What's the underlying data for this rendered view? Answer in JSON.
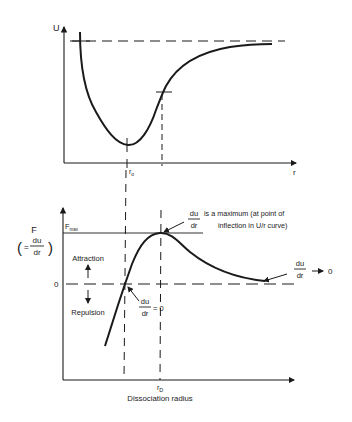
{
  "top_chart": {
    "y_axis_label": "U",
    "x_axis_label": "r",
    "r0_label": "r",
    "r0_subscript": "o",
    "asymptote": "dashed horizontal line (U → 0 at large r)",
    "curve": "potential energy well: steep repulsive wall at small r, minimum at r0, inflection point, asymptotic approach to dashed line",
    "curve_points": [
      [
        80,
        32
      ],
      [
        82,
        60
      ],
      [
        88,
        90
      ],
      [
        98,
        115
      ],
      [
        112,
        134
      ],
      [
        128,
        145
      ],
      [
        140,
        140
      ],
      [
        150,
        125
      ],
      [
        158,
        105
      ],
      [
        162,
        92
      ],
      [
        175,
        72
      ],
      [
        195,
        57
      ],
      [
        220,
        48
      ],
      [
        250,
        45
      ],
      [
        272,
        44
      ]
    ]
  },
  "bottom_chart": {
    "y_axis_label_top": "F",
    "y_axis_paren_open": "(",
    "y_axis_eq": "=",
    "y_axis_frac_num": "du",
    "y_axis_frac_den": "dr",
    "y_axis_paren_close": ")",
    "fmax_label": "F",
    "fmax_subscript": "max",
    "zero_label": "0",
    "attraction_label": "Attraction",
    "repulsion_label": "Repulsion",
    "zero_force_frac_num": "du",
    "zero_force_frac_den": "dr",
    "zero_force_eq": "= 0",
    "max_frac_num": "du",
    "max_frac_den": "dr",
    "max_text_line1": "is a maximum (at point of",
    "max_text_line2": "inflection in U/r curve)",
    "limit_frac_num": "du",
    "limit_frac_den": "dr",
    "limit_arrow": "→",
    "limit_value": "0",
    "rd_label": "r",
    "rd_subscript": "D",
    "x_axis_caption": "Dissociation radius"
  },
  "colors": {
    "line": "#1a1a1a",
    "background": "#ffffff"
  }
}
